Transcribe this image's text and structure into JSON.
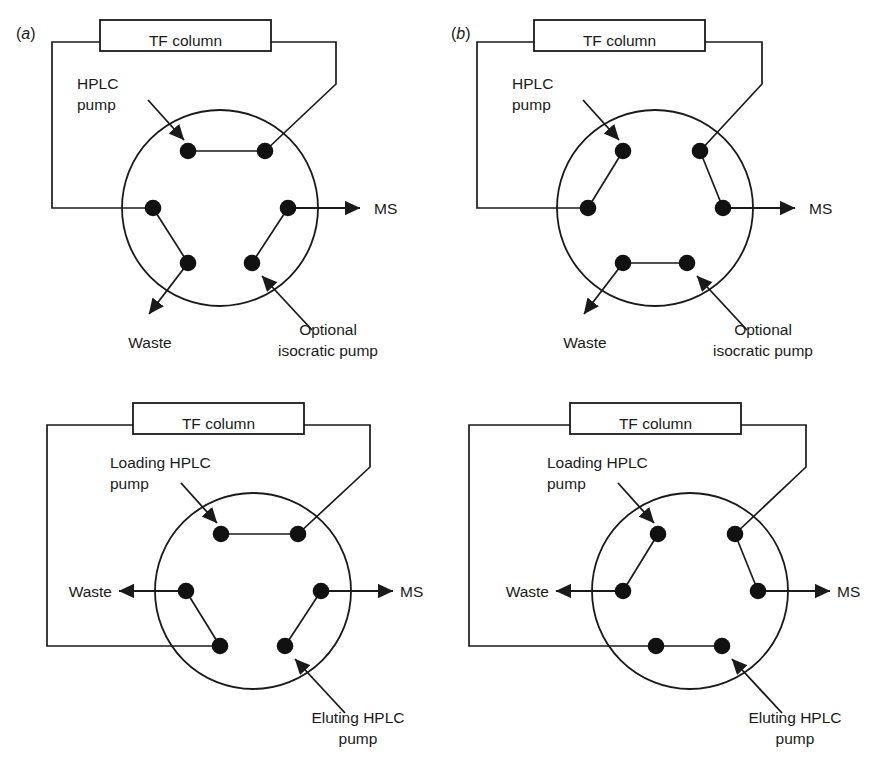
{
  "figure": {
    "type": "diagram",
    "panel_count": 4
  },
  "labels": {
    "tf_column": "TF column",
    "hplc_pump": "HPLC\npump",
    "hplc_pump_line1": "HPLC",
    "hplc_pump_line2": "pump",
    "loading_pump_line1": "Loading HPLC",
    "loading_pump_line2": "pump",
    "eluting_pump_line1": "Eluting HPLC",
    "eluting_pump_line2": "pump",
    "optional_line1": "Optional",
    "optional_line2": "isocratic pump",
    "waste": "Waste",
    "ms": "MS",
    "panel_a_open": "(",
    "panel_a_letter": "a",
    "panel_a_close": ")",
    "panel_b_open": "(",
    "panel_b_letter": "b",
    "panel_b_close": ")"
  },
  "panels": [
    {
      "id": "a",
      "tag": "(a)",
      "position": "top-left",
      "valve_ports": 6,
      "state": "loading",
      "connected_port_pairs": [
        [
          "top-left",
          "top-right"
        ],
        [
          "left",
          "bottom-left"
        ],
        [
          "bottom-right",
          "right"
        ]
      ],
      "annotations": [
        "HPLC pump",
        "TF column",
        "MS",
        "Waste",
        "Optional isocratic pump"
      ],
      "inlets": [
        "HPLC pump",
        "Optional isocratic pump"
      ],
      "outlets": [
        "MS",
        "Waste"
      ]
    },
    {
      "id": "b",
      "tag": "(b)",
      "position": "top-right",
      "valve_ports": 6,
      "state": "eluting",
      "connected_port_pairs": [
        [
          "top-left",
          "left"
        ],
        [
          "top-right",
          "right"
        ],
        [
          "bottom-left",
          "bottom-right"
        ]
      ],
      "annotations": [
        "HPLC pump",
        "TF column",
        "MS",
        "Waste",
        "Optional isocratic pump"
      ],
      "inlets": [
        "HPLC pump",
        "Optional isocratic pump"
      ],
      "outlets": [
        "MS",
        "Waste"
      ]
    },
    {
      "id": "c",
      "tag": "",
      "position": "bottom-left",
      "valve_ports": 6,
      "state": "loading",
      "connected_port_pairs": [
        [
          "top-left",
          "top-right"
        ],
        [
          "left",
          "bottom-left"
        ],
        [
          "bottom-right",
          "right"
        ]
      ],
      "annotations": [
        "Loading HPLC pump",
        "TF column",
        "MS",
        "Waste",
        "Eluting HPLC pump"
      ],
      "inlets": [
        "Loading HPLC pump",
        "Eluting HPLC pump"
      ],
      "outlets": [
        "MS",
        "Waste"
      ]
    },
    {
      "id": "d",
      "tag": "",
      "position": "bottom-right",
      "valve_ports": 6,
      "state": "eluting",
      "connected_port_pairs": [
        [
          "top-left",
          "left"
        ],
        [
          "top-right",
          "right"
        ],
        [
          "bottom-left",
          "bottom-right"
        ]
      ],
      "annotations": [
        "Loading HPLC pump",
        "TF column",
        "MS",
        "Waste",
        "Eluting HPLC pump"
      ],
      "inlets": [
        "Loading HPLC pump",
        "Eluting HPLC pump"
      ],
      "outlets": [
        "MS",
        "Waste"
      ]
    }
  ],
  "style": {
    "line_color": "#1a1a1a",
    "port_color": "#111111",
    "background": "#ffffff",
    "box_fill": "#ffffff"
  }
}
